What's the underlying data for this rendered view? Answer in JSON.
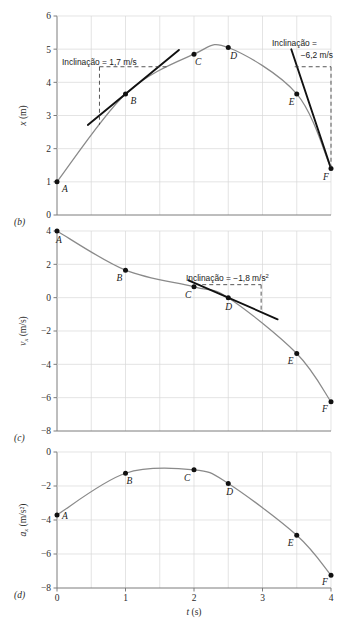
{
  "figure": {
    "xlabel_italic": "t",
    "xlabel_unit": "(s)",
    "xticks": [
      "0",
      "1",
      "2",
      "3",
      "4"
    ],
    "xtick_values": [
      0,
      1,
      2,
      3,
      4
    ],
    "xlim": [
      0,
      4
    ],
    "gridline_step": 0.5
  },
  "panels": [
    {
      "id": "b",
      "panel_label": "(b)",
      "ylabel_symbol": "x",
      "ylabel_sub": "",
      "ylabel_unit": "(m)",
      "yticks": [
        "6",
        "5",
        "4",
        "3",
        "2",
        "1",
        "0"
      ],
      "ytick_values": [
        6,
        5,
        4,
        3,
        2,
        1,
        0
      ],
      "ylim": [
        0,
        6
      ],
      "points": [
        {
          "label": "A",
          "t": 0.0,
          "v": 1.0
        },
        {
          "label": "B",
          "t": 1.0,
          "v": 3.65
        },
        {
          "label": "C",
          "t": 2.0,
          "v": 4.85
        },
        {
          "label": "D",
          "t": 2.5,
          "v": 5.05
        },
        {
          "label": "E",
          "t": 3.5,
          "v": 3.65
        },
        {
          "label": "F",
          "t": 4.0,
          "v": 1.4
        }
      ],
      "annotations": [
        {
          "name": "slope-at-B",
          "lines": [
            "Inclinação = 1,7 m/s"
          ],
          "sup": ""
        },
        {
          "name": "slope-at-F",
          "lines": [
            "Inclinação =",
            "−6,2 m/s"
          ],
          "sup": ""
        }
      ]
    },
    {
      "id": "c",
      "panel_label": "(c)",
      "ylabel_symbol": "v",
      "ylabel_sub": "x",
      "ylabel_unit": "(m/s)",
      "yticks": [
        "4",
        "2",
        "0",
        "−2",
        "−4",
        "−6",
        "−8"
      ],
      "ytick_values": [
        4,
        2,
        0,
        -2,
        -4,
        -6,
        -8
      ],
      "ylim": [
        -8,
        4
      ],
      "points": [
        {
          "label": "A",
          "t": 0.0,
          "v": 4.0
        },
        {
          "label": "B",
          "t": 1.0,
          "v": 1.65
        },
        {
          "label": "C",
          "t": 2.0,
          "v": 0.65
        },
        {
          "label": "D",
          "t": 2.5,
          "v": 0.0
        },
        {
          "label": "E",
          "t": 3.5,
          "v": -3.35
        },
        {
          "label": "F",
          "t": 4.0,
          "v": -6.25
        }
      ],
      "annotations": [
        {
          "name": "slope-at-D",
          "lines": [
            "Inclinação = −1,8 m/s"
          ],
          "sup": "2"
        }
      ]
    },
    {
      "id": "d",
      "panel_label": "(d)",
      "ylabel_symbol": "a",
      "ylabel_sub": "x",
      "ylabel_unit": "(m/s²)",
      "yticks": [
        "0",
        "−2",
        "−4",
        "−6",
        "−8"
      ],
      "ytick_values": [
        0,
        -2,
        -4,
        -6,
        -8
      ],
      "ylim": [
        -8,
        0
      ],
      "points": [
        {
          "label": "A",
          "t": 0.0,
          "v": -3.7
        },
        {
          "label": "B",
          "t": 1.0,
          "v": -1.25
        },
        {
          "label": "C",
          "t": 2.0,
          "v": -1.05
        },
        {
          "label": "D",
          "t": 2.5,
          "v": -1.85
        },
        {
          "label": "E",
          "t": 3.5,
          "v": -4.9
        },
        {
          "label": "F",
          "t": 4.0,
          "v": -7.25
        }
      ],
      "annotations": []
    }
  ],
  "chart_data": {
    "type": "line",
    "title": "",
    "xlabel": "t (s)",
    "x": [
      0,
      1,
      2,
      2.5,
      3.5,
      4
    ],
    "point_labels": [
      "A",
      "B",
      "C",
      "D",
      "E",
      "F"
    ],
    "grid": true,
    "legend": "none",
    "series": [
      {
        "name": "x (m)",
        "panel": "(b)",
        "ylabel": "x (m)",
        "ylim": [
          0,
          6
        ],
        "values": [
          1.0,
          3.65,
          4.85,
          5.05,
          3.65,
          1.4
        ]
      },
      {
        "name": "v_x (m/s)",
        "panel": "(c)",
        "ylabel": "v_x (m/s)",
        "ylim": [
          -8,
          4
        ],
        "values": [
          4.0,
          1.65,
          0.65,
          0.0,
          -3.35,
          -6.25
        ]
      },
      {
        "name": "a_x (m/s^2)",
        "panel": "(d)",
        "ylabel": "a_x (m/s²)",
        "ylim": [
          -8,
          0
        ],
        "values": [
          -3.7,
          -1.25,
          -1.05,
          -1.85,
          -4.9,
          -7.25
        ]
      }
    ],
    "annotations": [
      {
        "panel": "(b)",
        "text": "Inclinação = 1,7 m/s",
        "at_point": "B",
        "value": 1.7
      },
      {
        "panel": "(b)",
        "text": "Inclinação = −6,2 m/s",
        "at_point": "F",
        "value": -6.2
      },
      {
        "panel": "(c)",
        "text": "Inclinação = −1,8 m/s²",
        "at_point": "D",
        "value": -1.8
      }
    ]
  },
  "colors": {
    "curve": "#8a8a8a",
    "tangent": "#111111",
    "grid": "#d8d8d8",
    "axis": "#7d7d7d",
    "point": "#111111",
    "text": "#1a1a1a"
  }
}
